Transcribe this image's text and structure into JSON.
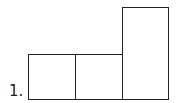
{
  "figure": {
    "label": "1.",
    "shapes": [
      {
        "name": "square-left",
        "x": 28,
        "y": 54,
        "w": 48,
        "h": 46
      },
      {
        "name": "square-middle",
        "x": 75,
        "y": 54,
        "w": 48,
        "h": 46
      },
      {
        "name": "tall-rectangle",
        "x": 122,
        "y": 7,
        "w": 47,
        "h": 93
      }
    ],
    "stroke_color": "#222222"
  }
}
